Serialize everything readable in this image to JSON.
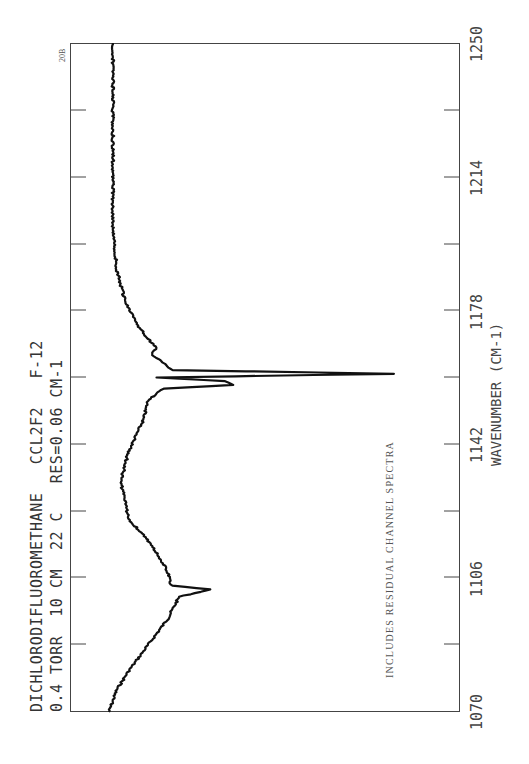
{
  "header": {
    "title_line1": "DICHLORODIFLUOROMETHANE   CCL2F2   F-12",
    "title_line2": "0.4 TORR  10 CM  22 C   RES=0.06 CM-1",
    "corner_code": "20B"
  },
  "axis": {
    "title": "WAVENUMBER (CM-1)",
    "tick_labels": [
      "1070",
      "1106",
      "1142",
      "1178",
      "1214",
      "1250"
    ]
  },
  "annotation": "INCLUDES RESIDUAL CHANNEL SPECTRA",
  "colors": {
    "trace": "#111111",
    "frame": "#444444",
    "background": "#ffffff"
  },
  "chart_data": {
    "type": "line",
    "xlabel": "WAVENUMBER (CM-1)",
    "ylabel": "",
    "orientation": "rotated 90 degrees (wavenumber runs bottom-to-top, signal runs left-to-right)",
    "xlim": [
      1070,
      1250
    ],
    "x_ticks": [
      1070,
      1088,
      1106,
      1124,
      1142,
      1160,
      1178,
      1196,
      1214,
      1232,
      1250
    ],
    "x_tick_labels": [
      "1070",
      "1106",
      "1142",
      "1178",
      "1214",
      "1250"
    ],
    "ylim": [
      0,
      100
    ],
    "grid": false,
    "annotations": [
      "INCLUDES RESIDUAL CHANNEL SPECTRA",
      "20B"
    ],
    "series": [
      {
        "name": "CCl2F2 spectrum",
        "x": [
          1070,
          1076,
          1081,
          1088,
          1095,
          1101,
          1103,
          1104,
          1108,
          1115,
          1122,
          1127,
          1132,
          1140,
          1149,
          1154,
          1157,
          1158,
          1159,
          1160,
          1161,
          1162,
          1164,
          1166,
          1168,
          1173,
          1181,
          1189,
          1200,
          1220,
          1250
        ],
        "values": [
          10,
          12,
          15,
          20,
          25,
          28,
          36,
          26,
          25,
          21,
          15,
          14,
          13,
          15,
          19,
          20,
          24,
          42,
          40,
          22,
          83,
          26,
          24,
          21,
          22,
          18,
          14,
          12,
          11,
          11,
          11
        ]
      }
    ]
  }
}
